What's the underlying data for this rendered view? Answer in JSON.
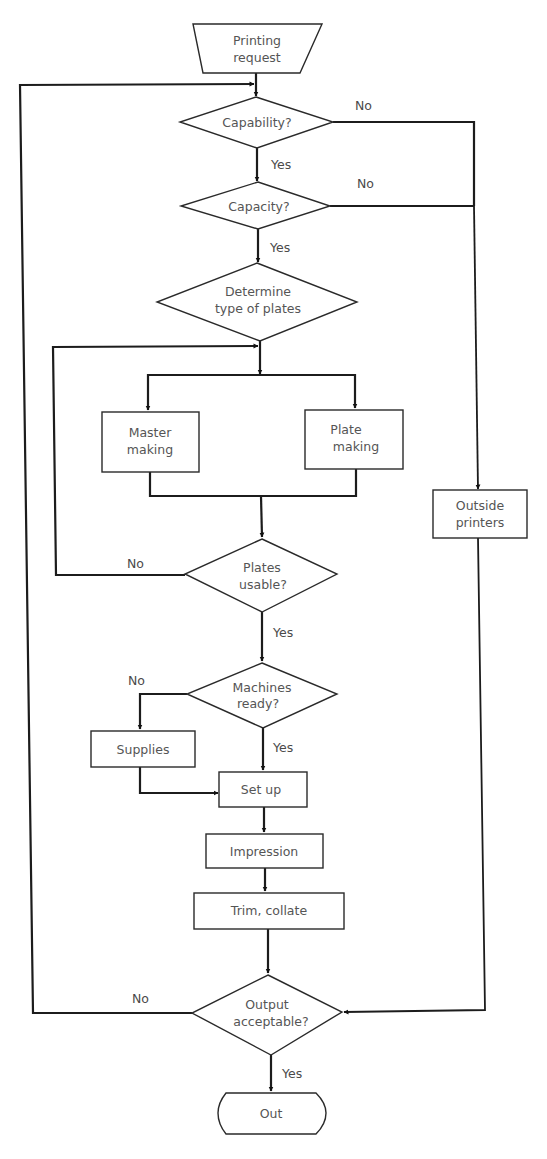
{
  "diagram": {
    "type": "flowchart",
    "nodes": {
      "start": {
        "shape": "trapezoid",
        "lines": [
          "Printing",
          "request"
        ]
      },
      "capability": {
        "shape": "decision",
        "lines": [
          "Capability?"
        ]
      },
      "capacity": {
        "shape": "decision",
        "lines": [
          "Capacity?"
        ]
      },
      "determine": {
        "shape": "decision",
        "lines": [
          "Determine",
          "type of plates"
        ]
      },
      "master": {
        "shape": "process",
        "lines": [
          "Master",
          "making"
        ]
      },
      "plate": {
        "shape": "process",
        "lines": [
          "Plate",
          "making"
        ]
      },
      "outside": {
        "shape": "process",
        "lines": [
          "Outside",
          "printers"
        ]
      },
      "usable": {
        "shape": "decision",
        "lines": [
          "Plates",
          "usable?"
        ]
      },
      "machines": {
        "shape": "decision",
        "lines": [
          "Machines",
          "ready?"
        ]
      },
      "supplies": {
        "shape": "process",
        "lines": [
          "Supplies"
        ]
      },
      "setup": {
        "shape": "process",
        "lines": [
          "Set up"
        ]
      },
      "impression": {
        "shape": "process",
        "lines": [
          "Impression"
        ]
      },
      "trim": {
        "shape": "process",
        "lines": [
          "Trim, collate"
        ]
      },
      "output": {
        "shape": "decision",
        "lines": [
          "Output",
          "acceptable?"
        ]
      },
      "out": {
        "shape": "terminal",
        "lines": [
          "Out"
        ]
      }
    },
    "edge_labels": {
      "capability_no": "No",
      "capability_yes": "Yes",
      "capacity_no": "No",
      "capacity_yes": "Yes",
      "usable_no": "No",
      "usable_yes": "Yes",
      "machines_no": "No",
      "machines_yes": "Yes",
      "output_no": "No",
      "output_yes": "Yes"
    },
    "edges": [
      {
        "from": "start",
        "to": "capability"
      },
      {
        "from": "capability",
        "to": "capacity",
        "label": "Yes"
      },
      {
        "from": "capability",
        "to": "outside",
        "label": "No"
      },
      {
        "from": "capacity",
        "to": "determine",
        "label": "Yes"
      },
      {
        "from": "capacity",
        "to": "outside",
        "label": "No"
      },
      {
        "from": "determine",
        "to": "master"
      },
      {
        "from": "determine",
        "to": "plate"
      },
      {
        "from": "master",
        "to": "usable"
      },
      {
        "from": "plate",
        "to": "usable"
      },
      {
        "from": "usable",
        "to": "determine",
        "label": "No"
      },
      {
        "from": "usable",
        "to": "machines",
        "label": "Yes"
      },
      {
        "from": "machines",
        "to": "supplies",
        "label": "No"
      },
      {
        "from": "machines",
        "to": "setup",
        "label": "Yes"
      },
      {
        "from": "supplies",
        "to": "setup"
      },
      {
        "from": "setup",
        "to": "impression"
      },
      {
        "from": "impression",
        "to": "trim"
      },
      {
        "from": "trim",
        "to": "output"
      },
      {
        "from": "outside",
        "to": "output"
      },
      {
        "from": "output",
        "to": "capability",
        "label": "No"
      },
      {
        "from": "output",
        "to": "out",
        "label": "Yes"
      }
    ],
    "colors": {
      "line": "#1c1c1c",
      "text": "#555555",
      "background": "#ffffff"
    }
  }
}
